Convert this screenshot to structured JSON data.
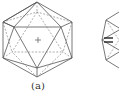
{
  "figure": {
    "panels": [
      {
        "label": "(a)",
        "shape": "icosahedron",
        "center_mark": "+"
      },
      {
        "label": "",
        "shape": "icosahedron-partial",
        "note": "second panel cropped at right edge"
      }
    ]
  },
  "colors": {
    "stroke": "#555555",
    "background": "#ffffff"
  }
}
